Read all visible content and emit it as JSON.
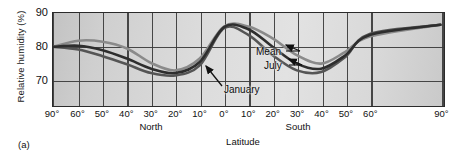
{
  "figure": {
    "panel_label": "(a)",
    "background": "#ffffff",
    "plot_fill": "#d8d8d8",
    "frame_color": "#2b2b2b",
    "grid_color": "#3a3a3a"
  },
  "axes": {
    "y_title": "Relative humidity (%)",
    "y_ticks": [
      "90",
      "80",
      "70"
    ],
    "x_title": "Latitude",
    "x_ticks": [
      "90°",
      "60°",
      "50°",
      "40°",
      "30°",
      "20°",
      "10°",
      "0°",
      "10°",
      "20°",
      "30°",
      "40°",
      "50°",
      "60°",
      "90°"
    ],
    "hemispheres": [
      {
        "label": "North"
      },
      {
        "label": "South"
      }
    ]
  },
  "annotations": [
    {
      "label": "Mean"
    },
    {
      "label": "July"
    },
    {
      "label": "January"
    }
  ],
  "chart_data": {
    "type": "line",
    "title": "",
    "xlabel": "Latitude",
    "ylabel": "Relative humidity (%)",
    "ylim": [
      62,
      90
    ],
    "yticks": [
      70,
      80,
      90
    ],
    "grid": true,
    "legend": "in-plot annotations with leader arrows",
    "x_axis_note": "Latitude from 90° North (left) through 0° equator to 90° South (right); spacing compressed between 60° and 90° at both ends",
    "x_tick_labels": [
      "90°",
      "60°",
      "50°",
      "40°",
      "30°",
      "20°",
      "10°",
      "0°",
      "10°",
      "20°",
      "30°",
      "40°",
      "50°",
      "60°",
      "90°"
    ],
    "x_signed": [
      -90,
      -60,
      -50,
      -40,
      -30,
      -20,
      -10,
      0,
      10,
      20,
      30,
      40,
      50,
      60,
      90
    ],
    "series": [
      {
        "name": "Mean",
        "color": "#2e2e2e",
        "values": [
          80.0,
          80.3,
          79.0,
          76.5,
          73.5,
          72.2,
          75.5,
          85.8,
          85.2,
          80.0,
          75.0,
          73.5,
          77.5,
          83.5,
          86.5
        ]
      },
      {
        "name": "July",
        "color": "#555555",
        "values": [
          80.0,
          79.2,
          77.2,
          74.8,
          72.2,
          71.5,
          74.5,
          85.5,
          83.5,
          77.5,
          73.0,
          72.5,
          77.0,
          83.8,
          86.5
        ]
      },
      {
        "name": "January",
        "color": "#8a8a8a",
        "values": [
          80.0,
          81.8,
          81.5,
          79.5,
          75.2,
          73.0,
          76.5,
          86.0,
          86.0,
          82.5,
          77.5,
          75.0,
          78.5,
          83.0,
          86.5
        ]
      }
    ]
  }
}
